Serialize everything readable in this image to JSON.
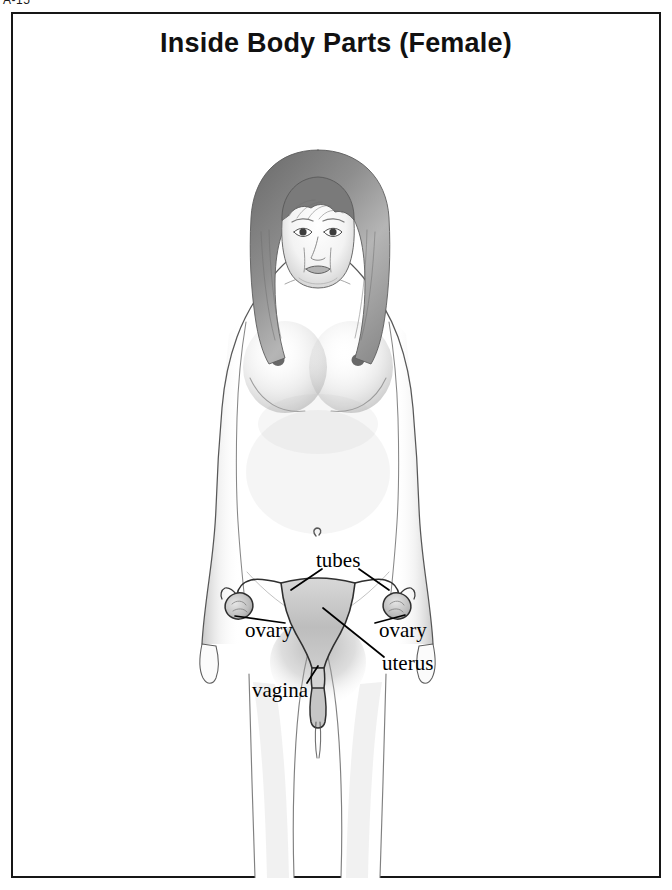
{
  "page_ref": "A-15",
  "plate": {
    "title": "Inside Body Parts (Female)",
    "border_color": "#171717",
    "background_color": "#ffffff"
  },
  "figure": {
    "name": "female-body-pencil-drawing",
    "style": "graphite-pencil-sketch",
    "ink_color": "#3a3a3a",
    "shade_color": "#b4b4b4"
  },
  "labels": [
    {
      "id": "tubes",
      "text": "tubes",
      "x": 303,
      "y": 488
    },
    {
      "id": "ovary-left",
      "text": "ovary",
      "x": 232,
      "y": 558
    },
    {
      "id": "ovary-right",
      "text": "ovary",
      "x": 366,
      "y": 558
    },
    {
      "id": "uterus",
      "text": "uterus",
      "x": 369,
      "y": 591
    },
    {
      "id": "vagina",
      "text": "vagina",
      "x": 239,
      "y": 618
    }
  ],
  "organ_diagram": {
    "name": "female-reproductive-organs",
    "parts": [
      "fallopian tubes",
      "ovaries",
      "uterus",
      "vagina"
    ],
    "outline_color": "#2b2b2b",
    "fill_color": "#c9c9c9"
  }
}
